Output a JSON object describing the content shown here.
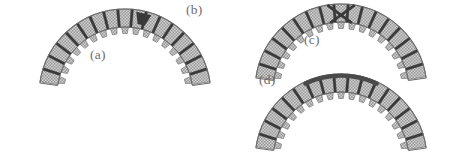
{
  "figure": {
    "background_color": "#ffffff",
    "width": 459,
    "height": 163,
    "style": {
      "voussoir_fill": "#c9c9c9",
      "voussoir_stipple": "#8a8a8a",
      "joint_color": "#3a3a3a",
      "outline_color": "#6b6b6b",
      "label_color": "#6d6d6d",
      "extrados_band": "#4a4a4a"
    },
    "labels": [
      {
        "id": "a",
        "text": "(a)",
        "x": 90,
        "y": 47,
        "describes": "arch-1-springing-region"
      },
      {
        "id": "b",
        "text": "(b)",
        "x": 186,
        "y": 2,
        "describes": "arch-1-extrados-crown"
      },
      {
        "id": "c",
        "text": "(c)",
        "x": 304,
        "y": 32,
        "describes": "arch-2-crown-crossing"
      },
      {
        "id": "d",
        "text": "(d)",
        "x": 259,
        "y": 72,
        "describes": "arch-3-crown"
      }
    ],
    "arches": [
      {
        "id": "arch-1",
        "name": "upper-left-arch",
        "cx": 125,
        "cy": 95,
        "r_outer": 86,
        "r_inner": 68,
        "start_angle": 188,
        "end_angle": 352,
        "voussoir_count": 17,
        "crown_marker": "dark-patch",
        "crown_marker_angle": 283,
        "notes": "segmental arch with stippled voussoirs and dark radial joints"
      },
      {
        "id": "arch-2",
        "name": "upper-right-arch",
        "cx": 341,
        "cy": 90,
        "r_outer": 86,
        "r_inner": 68,
        "start_angle": 188,
        "end_angle": 352,
        "voussoir_count": 17,
        "crown_marker": "x-crossing",
        "crown_marker_angle": 270,
        "notes": "crossed joint lines (X) at the crown"
      },
      {
        "id": "arch-3",
        "name": "lower-right-arch",
        "cx": 341,
        "cy": 160,
        "r_outer": 86,
        "r_inner": 68,
        "start_angle": 188,
        "end_angle": 352,
        "voussoir_count": 17,
        "crown_marker": "dark-extrados-band",
        "crown_marker_angle": 270,
        "notes": "continuous dark band along the extrados near the crown"
      }
    ]
  }
}
